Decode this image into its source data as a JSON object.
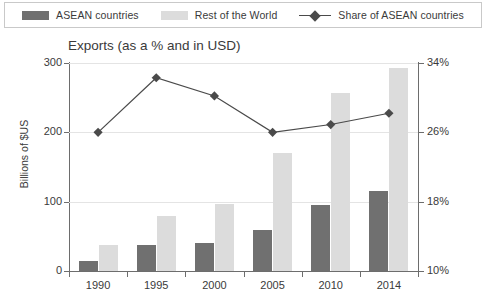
{
  "legend": {
    "items": [
      {
        "label": "ASEAN countries",
        "type": "swatch",
        "color": "#707070",
        "icon": "bar-swatch-icon"
      },
      {
        "label": "Rest of the World",
        "type": "swatch",
        "color": "#dcdcdc",
        "icon": "bar-swatch-icon"
      },
      {
        "label": "Share of ASEAN countries",
        "type": "line",
        "color": "#4a4a4a",
        "icon": "line-diamond-marker-icon"
      }
    ]
  },
  "chart_data": {
    "type": "bar",
    "title": "Exports (as a % and in USD)",
    "xlabel": "",
    "ylabel": "Billions of $US",
    "y2label": "",
    "categories": [
      "1990",
      "1995",
      "2000",
      "2005",
      "2010",
      "2014"
    ],
    "ylim": [
      0,
      300
    ],
    "yticks": [
      0,
      100,
      200,
      300
    ],
    "ytick_labels": [
      "0",
      "100",
      "200",
      "300"
    ],
    "y2lim": [
      10,
      34
    ],
    "y2ticks": [
      10,
      18,
      26,
      34
    ],
    "y2tick_labels": [
      "10%",
      "18%",
      "26%",
      "34%"
    ],
    "grid": true,
    "legend_position": "top",
    "series": [
      {
        "name": "ASEAN countries",
        "type": "bar",
        "axis": "left",
        "color": "#707070",
        "values": [
          14,
          38,
          41,
          59,
          95,
          115
        ]
      },
      {
        "name": "Rest of the World",
        "type": "bar",
        "axis": "left",
        "color": "#dcdcdc",
        "values": [
          38,
          80,
          97,
          170,
          257,
          293
        ]
      },
      {
        "name": "Share of ASEAN countries",
        "type": "line",
        "axis": "right",
        "color": "#4a4a4a",
        "marker": "diamond",
        "values": [
          26.0,
          32.3,
          30.2,
          26.0,
          26.9,
          28.2
        ]
      }
    ]
  }
}
